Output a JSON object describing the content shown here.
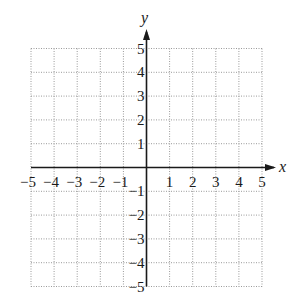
{
  "chart_data": {
    "type": "coordinate-grid",
    "title": "",
    "xlabel": "x",
    "ylabel": "y",
    "xlim": [
      -5,
      5
    ],
    "ylim": [
      -5,
      5
    ],
    "grid": true,
    "grid_style": "dotted",
    "x_ticks": [
      -5,
      -4,
      -3,
      -2,
      -1,
      1,
      2,
      3,
      4,
      5
    ],
    "y_ticks": [
      5,
      4,
      3,
      2,
      1,
      -1,
      -2,
      -3,
      -4,
      -5
    ],
    "x_tick_labels": [
      "−5",
      "−4",
      "−3",
      "−2",
      "−1",
      "1",
      "2",
      "3",
      "4",
      "5"
    ],
    "y_tick_labels": [
      "5",
      "4",
      "3",
      "2",
      "1",
      "−1",
      "−2",
      "−3",
      "−4",
      "−5"
    ],
    "series": []
  },
  "axes": {
    "x_label": "x",
    "y_label": "y"
  },
  "colors": {
    "axis": "#1a1a1a",
    "grid": "#9a9a9a",
    "background": "#ffffff"
  }
}
